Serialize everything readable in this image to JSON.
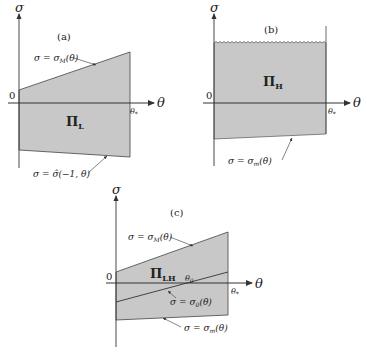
{
  "colors": {
    "fill": "#c8c8c8",
    "line": "#333333",
    "text": "#222222"
  },
  "panels": [
    {
      "id": "a",
      "label": "(a)",
      "region": "Π",
      "region_sub": "L",
      "axis_y": "σ",
      "axis_x": "θ",
      "origin": "0",
      "theta_star": "θ",
      "theta_star_sub": "*",
      "upper_curve": "σ = σ",
      "upper_curve_sub": "M",
      "upper_curve_arg": "(θ)",
      "lower_curve": "σ = σ̂(−1, θ)"
    },
    {
      "id": "b",
      "label": "(b)",
      "region": "Π",
      "region_sub": "H",
      "axis_y": "σ",
      "axis_x": "θ",
      "origin": "0",
      "theta_star": "θ",
      "theta_star_sub": "*",
      "lower_curve": "σ = σ",
      "lower_curve_sub": "m",
      "lower_curve_arg": "(θ)"
    },
    {
      "id": "c",
      "label": "(c)",
      "region": "Π",
      "region_sub": "LH",
      "axis_y": "σ",
      "axis_x": "θ",
      "origin": "0",
      "theta_star": "θ",
      "theta_star_sub": "*",
      "theta_zero": "θ",
      "theta_zero_sub": "0",
      "upper_curve": "σ = σ",
      "upper_curve_sub": "M",
      "upper_curve_arg": "(θ)",
      "middle_curve": "σ = σ",
      "middle_curve_sub": "0",
      "middle_curve_arg": "(θ)",
      "lower_curve": "σ = σ",
      "lower_curve_sub": "m",
      "lower_curve_arg": "(θ)"
    }
  ]
}
